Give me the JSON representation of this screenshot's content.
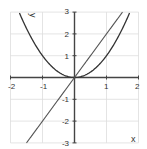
{
  "chart_data": {
    "type": "line",
    "title": "",
    "xlabel": "x",
    "ylabel": "y",
    "xlim": [
      -2,
      2
    ],
    "ylim": [
      -3,
      3
    ],
    "grid": true,
    "legend": null,
    "x_ticks": [
      -2,
      -1,
      0,
      1,
      2
    ],
    "x_tick_labels": [
      "-2",
      "-1",
      "",
      "1",
      "2"
    ],
    "y_ticks": [
      -3,
      -2,
      -1,
      0,
      1,
      2,
      3
    ],
    "y_tick_labels": [
      "-3",
      "-2",
      "-1",
      "",
      "1",
      "2",
      "3"
    ],
    "series": [
      {
        "name": "y = x^2",
        "kind": "parabola",
        "x": [
          -2,
          -1.73,
          -1.5,
          -1,
          -0.5,
          0,
          0.5,
          1,
          1.5,
          1.73,
          2
        ],
        "y": [
          4,
          3,
          2.25,
          1,
          0.25,
          0,
          0.25,
          1,
          2.25,
          3,
          4
        ],
        "color": "#333333"
      },
      {
        "name": "y = 2x",
        "kind": "line",
        "x": [
          -1.5,
          -1,
          0,
          1,
          1.5
        ],
        "y": [
          -3,
          -2,
          0,
          2,
          3
        ],
        "color": "#555555"
      }
    ]
  },
  "colors": {
    "grid": "#dddddd",
    "axis": "#444444",
    "curve": "#333333",
    "line": "#555555"
  },
  "labels": {
    "x_axis": "x",
    "y_axis": "y",
    "x_tick_minus2": "-2",
    "x_tick_minus1": "-1",
    "x_tick_1": "1",
    "x_tick_2": "2",
    "y_tick_3": "3",
    "y_tick_2": "2",
    "y_tick_1": "1",
    "y_tick_minus1": "-1",
    "y_tick_minus2": "-2",
    "y_tick_minus3": "-3"
  }
}
